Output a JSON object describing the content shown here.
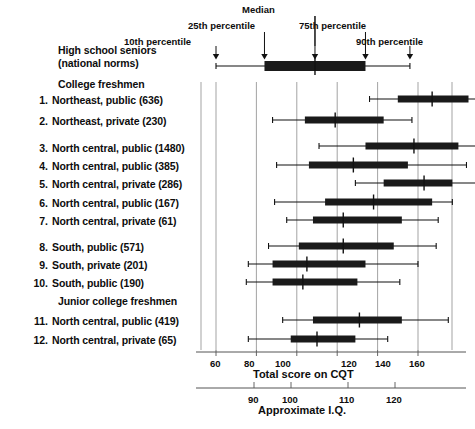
{
  "chart_data": {
    "type": "box",
    "title": "",
    "xlabel": "Total score on CQT",
    "secondary_xlabel": "Approximate I.Q.",
    "xlim": [
      52,
      168
    ],
    "xticks": [
      60,
      80,
      100,
      120,
      140,
      160
    ],
    "iq_ticks": [
      90,
      100,
      110,
      120
    ],
    "grid": "vertical gridlines at major x ticks",
    "legend": "none",
    "box_stats": "p10 (lower whisker), p25 (box left), median (tick), p75 (box right), p90 (upper whisker)",
    "annotations": [
      {
        "label": "10th percentile",
        "points_to": "lower whisker end"
      },
      {
        "label": "25th percentile",
        "points_to": "box left edge"
      },
      {
        "label": "Median",
        "points_to": "median tick"
      },
      {
        "label": "75th percentile",
        "points_to": "box right edge"
      },
      {
        "label": "90th percentile",
        "points_to": "upper whisker end"
      }
    ],
    "groups": [
      {
        "number": "",
        "label": "High school seniors",
        "label2": "(national norms)",
        "n": null,
        "p10": 60,
        "p25": 84,
        "median": 109,
        "p75": 134,
        "p90": 156
      },
      {
        "number": "",
        "label": "College freshmen",
        "header": true
      },
      {
        "number": "1.",
        "label": "Northeast, public",
        "n": 636,
        "p10": 136,
        "p25": 150,
        "median": 167,
        "p75": 185,
        "p90": 192
      },
      {
        "number": "2.",
        "label": "Northeast, private",
        "n": 230,
        "p10": 88,
        "p25": 104,
        "median": 119,
        "p75": 143,
        "p90": 157
      },
      {
        "number": "3.",
        "label": "North central, public",
        "n": 1480,
        "p10": 111,
        "p25": 134,
        "median": 158,
        "p75": 180,
        "p90": 193
      },
      {
        "number": "4.",
        "label": "North central, public",
        "n": 385,
        "p10": 90,
        "p25": 106,
        "median": 128,
        "p75": 155,
        "p90": 184
      },
      {
        "number": "5.",
        "label": "North central, private",
        "n": 286,
        "p10": 129,
        "p25": 143,
        "median": 163,
        "p75": 177,
        "p90": 193
      },
      {
        "number": "6.",
        "label": "North central, public",
        "n": 167,
        "p10": 89,
        "p25": 114,
        "median": 138,
        "p75": 167,
        "p90": 177
      },
      {
        "number": "7.",
        "label": "North central, private",
        "n": 61,
        "p10": 95,
        "p25": 108,
        "median": 123,
        "p75": 152,
        "p90": 170
      },
      {
        "number": "8.",
        "label": "South, public",
        "n": 571,
        "p10": 86,
        "p25": 101,
        "median": 123,
        "p75": 148,
        "p90": 169
      },
      {
        "number": "9.",
        "label": "South, private",
        "n": 201,
        "p10": 76,
        "p25": 88,
        "median": 105,
        "p75": 134,
        "p90": 160
      },
      {
        "number": "10.",
        "label": "South, public",
        "n": 190,
        "p10": 75,
        "p25": 88,
        "median": 103,
        "p75": 130,
        "p90": 151
      },
      {
        "number": "",
        "label": "Junior college freshmen",
        "header": true
      },
      {
        "number": "11.",
        "label": "North central, public",
        "n": 419,
        "p10": 93,
        "p25": 108,
        "median": 131,
        "p75": 152,
        "p90": 175
      },
      {
        "number": "12.",
        "label": "North central, private",
        "n": 65,
        "p10": 76,
        "p25": 97,
        "median": 110,
        "p75": 129,
        "p90": 145
      }
    ]
  },
  "labels": {
    "row_hs_line1": "High school seniors",
    "row_hs_line2": "(national norms)",
    "row_college_header": "College freshmen",
    "row_junior_header": "Junior college freshmen",
    "rows": [
      {
        "num": "1.",
        "text": "Northeast, public (636)"
      },
      {
        "num": "2.",
        "text": "Northeast, private (230)"
      },
      {
        "num": "3.",
        "text": "North central, public (1480)"
      },
      {
        "num": "4.",
        "text": "North central, public (385)"
      },
      {
        "num": "5.",
        "text": "North central, private (286)"
      },
      {
        "num": "6.",
        "text": "North central, public (167)"
      },
      {
        "num": "7.",
        "text": "North central, private (61)"
      },
      {
        "num": "8.",
        "text": "South, public (571)"
      },
      {
        "num": "9.",
        "text": "South, private (201)"
      },
      {
        "num": "10.",
        "text": "South, public (190)"
      },
      {
        "num": "11.",
        "text": "North central, public (419)"
      },
      {
        "num": "12.",
        "text": "North central, private (65)"
      }
    ]
  },
  "annotations": {
    "median": "Median",
    "p25": "25th percentile",
    "p75": "75th percentile",
    "p10": "10th percentile",
    "p90": "90th percentile"
  },
  "axes": {
    "primary_label": "Total score on CQT",
    "secondary_label": "Approximate I.Q.",
    "primary_ticks": [
      "60",
      "80",
      "100",
      "120",
      "140",
      "160"
    ],
    "secondary_ticks": [
      "90",
      "100",
      "110",
      "120"
    ]
  },
  "colors": {
    "ink": "#111111",
    "box_fill": "#1a1a1a",
    "gridline": "#999999",
    "axis": "#555555"
  }
}
